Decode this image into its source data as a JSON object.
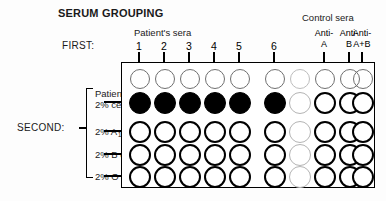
{
  "figure": {
    "title": "SERUM GROUPING",
    "width": 386,
    "height": 201
  },
  "headers": {
    "patient_sera": "Patient's sera",
    "control_sera": "Control sera",
    "first": "FIRST:",
    "second": "SECOND:"
  },
  "columns": [
    {
      "id": "col-1",
      "label": "1",
      "group": "patient",
      "x": 139
    },
    {
      "id": "col-2",
      "label": "2",
      "group": "patient",
      "x": 164
    },
    {
      "id": "col-3",
      "label": "3",
      "group": "patient",
      "x": 189
    },
    {
      "id": "col-4",
      "label": "4",
      "group": "patient",
      "x": 214
    },
    {
      "id": "col-5",
      "label": "5",
      "group": "patient",
      "x": 239
    },
    {
      "id": "col-6",
      "label": "6",
      "group": "patient",
      "x": 274
    },
    {
      "id": "col-blank",
      "label": "",
      "group": "blank",
      "x": 299
    },
    {
      "id": "col-anti-a",
      "label_line1": "Anti-",
      "label_line2": "A",
      "group": "control",
      "x": 324
    },
    {
      "id": "col-anti-b",
      "label_line1": "Anti-",
      "label_line2": "B",
      "group": "control",
      "x": 349
    },
    {
      "id": "col-anti-ab",
      "label_line1": "Anti-",
      "label_line2": "A+B",
      "group": "control",
      "x": 362
    }
  ],
  "rows": [
    {
      "id": "row-entry",
      "label": "",
      "label2": "",
      "y": 78,
      "type": "entry"
    },
    {
      "id": "row-patient-cells",
      "label": "Patient's",
      "label2": "2% cells",
      "y": 102,
      "type": "test"
    },
    {
      "id": "row-a1-cells",
      "label": "2% A",
      "sub": "1",
      "label_tail": " cells",
      "y": 131,
      "type": "test"
    },
    {
      "id": "row-b-cells",
      "label": "2% B cells",
      "y": 154,
      "type": "test"
    },
    {
      "id": "row-o-cells",
      "label": "2% O cells",
      "y": 176,
      "type": "test"
    }
  ],
  "wells": {
    "entry_row": [
      {
        "col": "col-1",
        "state": "open"
      },
      {
        "col": "col-2",
        "state": "open"
      },
      {
        "col": "col-3",
        "state": "open"
      },
      {
        "col": "col-4",
        "state": "open"
      },
      {
        "col": "col-5",
        "state": "open"
      },
      {
        "col": "col-6",
        "state": "open"
      },
      {
        "col": "col-blank",
        "state": "faint"
      },
      {
        "col": "col-anti-a",
        "state": "open"
      },
      {
        "col": "col-anti-b",
        "state": "open"
      },
      {
        "col": "col-anti-ab",
        "state": "open"
      }
    ],
    "patient_cells_row": [
      {
        "col": "col-1",
        "state": "filled"
      },
      {
        "col": "col-2",
        "state": "filled"
      },
      {
        "col": "col-3",
        "state": "filled"
      },
      {
        "col": "col-4",
        "state": "filled"
      },
      {
        "col": "col-5",
        "state": "filled"
      },
      {
        "col": "col-6",
        "state": "filled"
      },
      {
        "col": "col-blank",
        "state": "faint"
      },
      {
        "col": "col-anti-a",
        "state": "open-thin"
      },
      {
        "col": "col-anti-b",
        "state": "open-thin"
      },
      {
        "col": "col-anti-ab",
        "state": "open-thin"
      }
    ],
    "a1_cells_row": [
      {
        "col": "col-1",
        "state": "open"
      },
      {
        "col": "col-2",
        "state": "open"
      },
      {
        "col": "col-3",
        "state": "open"
      },
      {
        "col": "col-4",
        "state": "open"
      },
      {
        "col": "col-5",
        "state": "open"
      },
      {
        "col": "col-6",
        "state": "open"
      },
      {
        "col": "col-blank",
        "state": "faint"
      },
      {
        "col": "col-anti-a",
        "state": "open"
      },
      {
        "col": "col-anti-b",
        "state": "open"
      },
      {
        "col": "col-anti-ab",
        "state": "open"
      }
    ],
    "b_cells_row": [
      {
        "col": "col-1",
        "state": "open"
      },
      {
        "col": "col-2",
        "state": "open"
      },
      {
        "col": "col-3",
        "state": "open"
      },
      {
        "col": "col-4",
        "state": "open"
      },
      {
        "col": "col-5",
        "state": "open"
      },
      {
        "col": "col-6",
        "state": "open"
      },
      {
        "col": "col-blank",
        "state": "faint"
      },
      {
        "col": "col-anti-a",
        "state": "open"
      },
      {
        "col": "col-anti-b",
        "state": "open"
      },
      {
        "col": "col-anti-ab",
        "state": "open"
      }
    ],
    "o_cells_row": [
      {
        "col": "col-1",
        "state": "open"
      },
      {
        "col": "col-2",
        "state": "open"
      },
      {
        "col": "col-3",
        "state": "open"
      },
      {
        "col": "col-4",
        "state": "open"
      },
      {
        "col": "col-5",
        "state": "open"
      },
      {
        "col": "col-6",
        "state": "open"
      },
      {
        "col": "col-blank",
        "state": "faint"
      },
      {
        "col": "col-anti-a",
        "state": "open"
      },
      {
        "col": "col-anti-b",
        "state": "open"
      },
      {
        "col": "col-anti-ab",
        "state": "open"
      }
    ]
  },
  "arrows": {
    "vertical": [
      {
        "col": "col-1",
        "from_y": 52,
        "to_y": 95
      },
      {
        "col": "col-2",
        "from_y": 52,
        "to_y": 95
      },
      {
        "col": "col-3",
        "from_y": 52,
        "to_y": 95
      },
      {
        "col": "col-4",
        "from_y": 52,
        "to_y": 95
      },
      {
        "col": "col-5",
        "from_y": 52,
        "to_y": 95
      },
      {
        "col": "col-6",
        "from_y": 52,
        "to_y": 95
      },
      {
        "col": "col-anti-a",
        "from_y": 52,
        "to_y": 123
      },
      {
        "col": "col-anti-b",
        "from_y": 52,
        "to_y": 123
      },
      {
        "col": "col-anti-ab",
        "from_y": 52,
        "to_y": 123
      }
    ],
    "horizontal": [
      {
        "row": "row-patient-cells",
        "y": 102
      },
      {
        "row": "row-a1-cells",
        "y": 131
      },
      {
        "row": "row-b-cells",
        "y": 154
      },
      {
        "row": "row-o-cells",
        "y": 176
      }
    ]
  },
  "colors": {
    "ink": "#000000",
    "faint": "#b4b4b4",
    "background": "#ffffff"
  }
}
